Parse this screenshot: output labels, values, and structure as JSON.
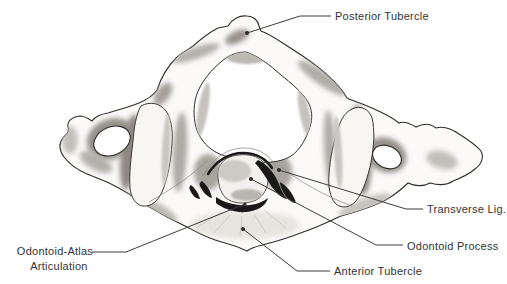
{
  "figure": {
    "background_color": "#ffffff",
    "ink_color": "#2f2d2a",
    "label_text_color": "#333333",
    "leader_line_color": "#3f3d3a",
    "dark_mark_color": "#191919",
    "shading_color": "#a8a49e",
    "labels": {
      "posterior_tubercle": "Posterior Tubercle",
      "transverse_lig": "Transverse Lig.",
      "odontoid_process": "Odontoid Process",
      "anterior_tubercle": "Anterior Tubercle",
      "odontoid_atlas_line1": "Odontoid-Atlas",
      "odontoid_atlas_line2": "Articulation"
    }
  }
}
